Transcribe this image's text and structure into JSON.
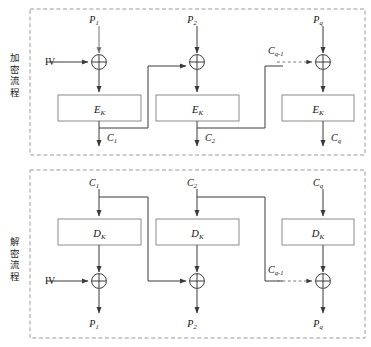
{
  "figure": {
    "type": "cipher-block-chaining-diagram",
    "sections": [
      {
        "id": "encryption",
        "label": "加密流程",
        "cipher_box_label": "E",
        "cipher_box_subscript": "K",
        "iv_label": "IV",
        "top_inputs": [
          "P",
          "P",
          "P"
        ],
        "top_input_subscripts": [
          "1",
          "2",
          "q"
        ],
        "bottom_outputs": [
          "C",
          "C",
          "C"
        ],
        "bottom_output_subscripts": [
          "1",
          "2",
          "q"
        ],
        "feedback_label": "C",
        "feedback_subscript": "q-1",
        "xor_symbol": "⊕"
      },
      {
        "id": "decryption",
        "label": "解密流程",
        "cipher_box_label": "D",
        "cipher_box_subscript": "K",
        "iv_label": "IV",
        "top_inputs": [
          "C",
          "C",
          "C"
        ],
        "top_input_subscripts": [
          "1",
          "2",
          "q"
        ],
        "bottom_outputs": [
          "P",
          "P",
          "P"
        ],
        "bottom_output_subscripts": [
          "1",
          "2",
          "q"
        ],
        "feedback_label": "C",
        "feedback_subscript": "q-1",
        "xor_symbol": "⊕"
      }
    ],
    "colors": {
      "line": "#3a3a3a",
      "box_stroke": "#8a8a8a",
      "panel_border": "#9a9a9a",
      "text": "#111111",
      "background": "#ffffff"
    }
  }
}
